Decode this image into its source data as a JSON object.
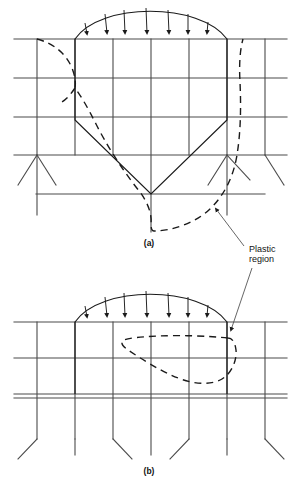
{
  "figure": {
    "background_color": "#ffffff",
    "line_color": "#1a1a1a",
    "grid_color": "#4a4a4a",
    "width": 301,
    "height": 493,
    "panels": [
      {
        "id": "a",
        "caption": "(a)",
        "caption_x": 149,
        "caption_y": 246,
        "description": "Grid of a loaded body with V-shaped wedge indentation and large dashed plastic region boundary",
        "load_arrow_count": 7,
        "plastic_region_shape": "large-irregular-lobe"
      },
      {
        "id": "b",
        "caption": "(b)",
        "caption_x": 149,
        "caption_y": 474,
        "description": "Grid of a loaded body with lens-shaped dashed plastic region beneath the load",
        "load_arrow_count": 7,
        "plastic_region_shape": "lens-loop"
      }
    ],
    "annotations": [
      {
        "name": "plastic-region-label",
        "lines": [
          "Plastic",
          "region"
        ],
        "text_x": 249,
        "text_line1_y": 252,
        "text_line2_y": 262,
        "leader_from_x": 244,
        "leader_from_y": 246,
        "leader_to_x": 216,
        "leader_to_y": 209,
        "leader2_from_x": 252,
        "leader2_from_y": 268,
        "leader2_to_x": 231,
        "leader2_to_y": 330
      }
    ],
    "footer_note": ""
  }
}
